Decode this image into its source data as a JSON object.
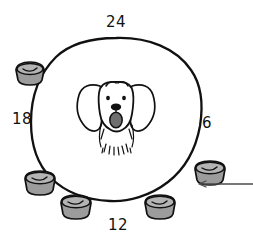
{
  "figure": {
    "type": "hand-drawn-illustration",
    "background_color": "#ffffff",
    "ink_color": "#111111"
  },
  "clock": {
    "center": {
      "x": 116,
      "y": 120
    },
    "radius_x": 84,
    "radius_y": 82,
    "stroke_color": "#111111",
    "stroke_width": 2.2,
    "hour_labels": [
      {
        "text": "24",
        "position": "top",
        "x": 116,
        "y": 22,
        "angle_deg": 0
      },
      {
        "text": "6",
        "position": "right",
        "x": 207,
        "y": 122,
        "angle_deg": 90
      },
      {
        "text": "12",
        "position": "bottom",
        "x": 117,
        "y": 226,
        "angle_deg": 180
      },
      {
        "text": "18",
        "position": "left",
        "x": 21,
        "y": 118,
        "angle_deg": 270
      }
    ]
  },
  "dog": {
    "label": "dog face",
    "center": {
      "x": 116,
      "y": 110
    },
    "nose_color": "#111111",
    "tongue_color": "#6e6e6e",
    "outline_color": "#111111",
    "fill_color": "#ffffff",
    "features": [
      "floppy-ears",
      "two-eyes",
      "nose",
      "tongue",
      "beard-fur"
    ]
  },
  "bowls": {
    "count": 5,
    "fill_color": "#9c9c9c",
    "rim_fill_color": "#b4b4b4",
    "outline_color": "#111111",
    "items": [
      {
        "id": "bowl-1",
        "x": 30,
        "y": 71,
        "w": 34,
        "h": 22,
        "near_hour": "20"
      },
      {
        "id": "bowl-2",
        "x": 40,
        "y": 180,
        "w": 36,
        "h": 23,
        "near_hour": "14"
      },
      {
        "id": "bowl-3",
        "x": 76,
        "y": 204,
        "w": 36,
        "h": 23,
        "near_hour": "12.5"
      },
      {
        "id": "bowl-4",
        "x": 160,
        "y": 204,
        "w": 36,
        "h": 23,
        "near_hour": "10"
      },
      {
        "id": "bowl-5",
        "x": 210,
        "y": 170,
        "w": 36,
        "h": 23,
        "near_hour": "8"
      }
    ]
  },
  "annotation": {
    "leader_line": {
      "label": "leader-line-to-bowl",
      "from_x": 253,
      "from_y": 184,
      "to_x": 198,
      "to_y": 184,
      "stroke_color": "#4a4a4a",
      "stroke_width": 1.2,
      "arrow_at": "left"
    }
  }
}
